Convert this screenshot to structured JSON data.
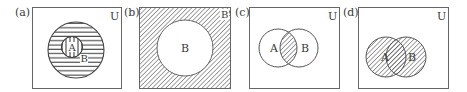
{
  "figure": {
    "colors": {
      "stroke": "#555555",
      "hatch": "#555555",
      "background": "#ffffff"
    },
    "panels": [
      {
        "id": "a",
        "tag": "(a)",
        "universe_label": "U",
        "circle_labels": [
          "A",
          "B"
        ],
        "relation": "A is a subset of B (A shaded vertical, B shaded horizontal)"
      },
      {
        "id": "b",
        "tag": "(b)",
        "complement_label": "B'",
        "circle_labels": [
          "B"
        ],
        "relation": "Complement of B shaded"
      },
      {
        "id": "c",
        "tag": "(c)",
        "universe_label": "U",
        "circle_labels": [
          "A",
          "B"
        ],
        "relation": "A intersection B shaded"
      },
      {
        "id": "d",
        "tag": "(d)",
        "universe_label": "U",
        "circle_labels": [
          "A",
          "B"
        ],
        "relation": "A union B shaded"
      }
    ]
  }
}
